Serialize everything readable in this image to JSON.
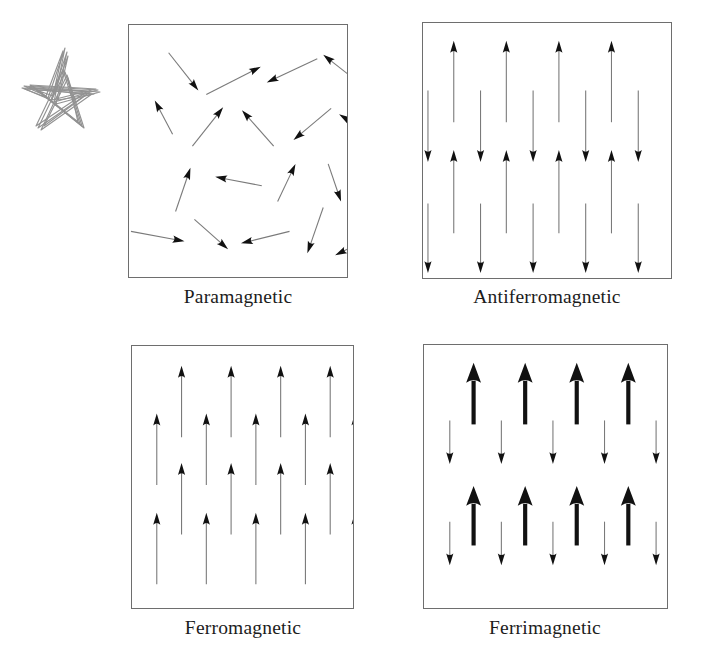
{
  "figure": {
    "doodle": {
      "name": "hand-drawn-star-scribble",
      "color": "#8d8d8d"
    },
    "arrow_styles": {
      "thin": {
        "shaft_color": "#7a7a7a",
        "head_color": "#111111",
        "shaft_width": 1.1
      },
      "thick": {
        "shaft_color": "#111111",
        "head_color": "#111111",
        "shaft_width": 4.2
      }
    },
    "border_color": "#6e6e6e",
    "panels": [
      {
        "id": "paramagnetic",
        "label": "Paramagnetic",
        "description": "Randomly oriented magnetic moments",
        "arrow_style": "thin",
        "viewbox": "0 0 220 254",
        "arrows": [
          {
            "x1": 40,
            "y1": 28,
            "x2": 70,
            "y2": 66
          },
          {
            "x1": 78,
            "y1": 70,
            "x2": 133,
            "y2": 42
          },
          {
            "x1": 190,
            "y1": 34,
            "x2": 139,
            "y2": 58
          },
          {
            "x1": 237,
            "y1": 62,
            "x2": 196,
            "y2": 30
          },
          {
            "x1": 44,
            "y1": 110,
            "x2": 26,
            "y2": 76
          },
          {
            "x1": 64,
            "y1": 122,
            "x2": 95,
            "y2": 83
          },
          {
            "x1": 146,
            "y1": 122,
            "x2": 114,
            "y2": 86
          },
          {
            "x1": 204,
            "y1": 84,
            "x2": 166,
            "y2": 116
          },
          {
            "x1": 247,
            "y1": 112,
            "x2": 212,
            "y2": 90
          },
          {
            "x1": 47,
            "y1": 188,
            "x2": 62,
            "y2": 144
          },
          {
            "x1": 134,
            "y1": 162,
            "x2": 87,
            "y2": 153
          },
          {
            "x1": 150,
            "y1": 178,
            "x2": 168,
            "y2": 140
          },
          {
            "x1": 201,
            "y1": 140,
            "x2": 214,
            "y2": 178
          },
          {
            "x1": 2,
            "y1": 208,
            "x2": 56,
            "y2": 218
          },
          {
            "x1": 66,
            "y1": 196,
            "x2": 100,
            "y2": 226
          },
          {
            "x1": 162,
            "y1": 208,
            "x2": 113,
            "y2": 220
          },
          {
            "x1": 196,
            "y1": 184,
            "x2": 180,
            "y2": 230
          },
          {
            "x1": 245,
            "y1": 214,
            "x2": 208,
            "y2": 232
          }
        ]
      },
      {
        "id": "antiferromagnetic",
        "label": "Antiferromagnetic",
        "description": "Alternating up and down moments of equal magnitude",
        "arrow_style": "thin",
        "viewbox": "0 0 250 257",
        "rows": [
          {
            "direction": "up",
            "count": 4,
            "y_tail": 100,
            "y_head": 18,
            "x_start": 31,
            "x_step": 53
          },
          {
            "direction": "down",
            "count": 5,
            "y_tail": 68,
            "y_head": 140,
            "x_start": 5,
            "x_step": 53
          },
          {
            "direction": "up",
            "count": 4,
            "y_tail": 212,
            "y_head": 128,
            "x_start": 31,
            "x_step": 53
          },
          {
            "direction": "down",
            "count": 5,
            "y_tail": 182,
            "y_head": 252,
            "x_start": 5,
            "x_step": 53
          }
        ]
      },
      {
        "id": "ferromagnetic",
        "label": "Ferromagnetic",
        "description": "All moments aligned parallel and equal in magnitude",
        "arrow_style": "thin",
        "viewbox": "0 0 223 264",
        "rows": [
          {
            "direction": "up",
            "count": 4,
            "y_tail": 92,
            "y_head": 20,
            "x_start": 50,
            "x_step": 50
          },
          {
            "direction": "up",
            "count": 5,
            "y_tail": 140,
            "y_head": 68,
            "x_start": 25,
            "x_step": 50
          },
          {
            "direction": "up",
            "count": 4,
            "y_tail": 190,
            "y_head": 118,
            "x_start": 50,
            "x_step": 50
          },
          {
            "direction": "up",
            "count": 5,
            "y_tail": 240,
            "y_head": 168,
            "x_start": 25,
            "x_step": 50
          }
        ]
      },
      {
        "id": "ferrimagnetic",
        "label": "Ferrimagnetic",
        "description": "Antiparallel moments of unequal magnitude",
        "arrow_style": "mixed",
        "viewbox": "0 0 245 265",
        "rows": [
          {
            "direction": "up",
            "count": 4,
            "size": "thick",
            "y_tail": 80,
            "y_head": 18,
            "x_start": 50,
            "x_step": 52
          },
          {
            "direction": "down",
            "count": 5,
            "size": "thin",
            "y_tail": 76,
            "y_head": 120,
            "x_start": 26,
            "x_step": 52
          },
          {
            "direction": "up",
            "count": 4,
            "size": "thick",
            "y_tail": 202,
            "y_head": 142,
            "x_start": 50,
            "x_step": 52
          },
          {
            "direction": "down",
            "count": 5,
            "size": "thin",
            "y_tail": 178,
            "y_head": 222,
            "x_start": 26,
            "x_step": 52
          }
        ]
      }
    ]
  }
}
